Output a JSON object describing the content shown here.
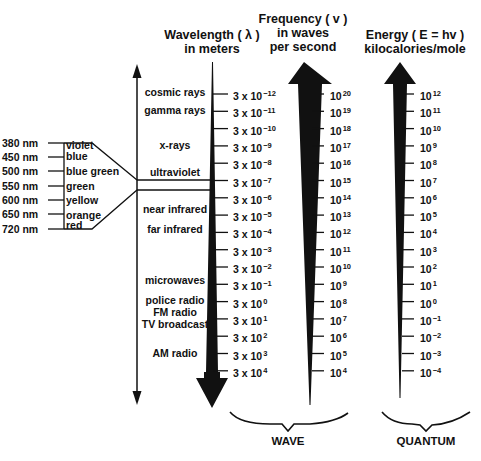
{
  "headers": {
    "wavelength": {
      "line1": "Wavelength ( λ )",
      "line2": "in meters"
    },
    "frequency": {
      "line1": "Frequency ( v )",
      "line2": "in waves",
      "line3": "per second"
    },
    "energy": {
      "line1": "Energy ( E = hv )",
      "line2": "kilocalories/mole"
    }
  },
  "bands": [
    {
      "label": "cosmic rays"
    },
    {
      "label": "gamma rays"
    },
    {
      "label": "x-rays"
    },
    {
      "label": "ultraviolet"
    },
    {
      "label": "near infrared"
    },
    {
      "label": "far infrared"
    },
    {
      "label": "microwaves"
    },
    {
      "label": "police radio"
    },
    {
      "label": "FM radio"
    },
    {
      "label": "TV broadcast"
    },
    {
      "label": "AM radio"
    }
  ],
  "visible_light": {
    "wavelengths": [
      "380 nm",
      "450 nm",
      "500 nm",
      "550 nm",
      "600 nm",
      "650 nm",
      "720 nm"
    ],
    "colors": [
      "violet",
      "blue",
      "blue green",
      "green",
      "yellow",
      "orange",
      "red"
    ]
  },
  "wavelength_ticks": [
    {
      "base": "3 x 10",
      "exp": "−12"
    },
    {
      "base": "3 x 10",
      "exp": "−11"
    },
    {
      "base": "3 x 10",
      "exp": "−10"
    },
    {
      "base": "3 x 10",
      "exp": "−9"
    },
    {
      "base": "3 x 10",
      "exp": "−8"
    },
    {
      "base": "3 x 10",
      "exp": "−7"
    },
    {
      "base": "3 x 10",
      "exp": "−6"
    },
    {
      "base": "3 x 10",
      "exp": "−5"
    },
    {
      "base": "3 x 10",
      "exp": "−4"
    },
    {
      "base": "3 x 10",
      "exp": "−3"
    },
    {
      "base": "3 x 10",
      "exp": "−2"
    },
    {
      "base": "3 x 10",
      "exp": "−1"
    },
    {
      "base": "3 x 10",
      "exp": "0"
    },
    {
      "base": "3 x 10",
      "exp": "1"
    },
    {
      "base": "3 x 10",
      "exp": "2"
    },
    {
      "base": "3 x 10",
      "exp": "3"
    },
    {
      "base": "3 x 10",
      "exp": "4"
    }
  ],
  "frequency_ticks": [
    {
      "base": "10",
      "exp": "20"
    },
    {
      "base": "10",
      "exp": "19"
    },
    {
      "base": "10",
      "exp": "18"
    },
    {
      "base": "10",
      "exp": "17"
    },
    {
      "base": "10",
      "exp": "16"
    },
    {
      "base": "10",
      "exp": "15"
    },
    {
      "base": "10",
      "exp": "14"
    },
    {
      "base": "10",
      "exp": "13"
    },
    {
      "base": "10",
      "exp": "12"
    },
    {
      "base": "10",
      "exp": "11"
    },
    {
      "base": "10",
      "exp": "10"
    },
    {
      "base": "10",
      "exp": "9"
    },
    {
      "base": "10",
      "exp": "8"
    },
    {
      "base": "10",
      "exp": "7"
    },
    {
      "base": "10",
      "exp": "6"
    },
    {
      "base": "10",
      "exp": "5"
    },
    {
      "base": "10",
      "exp": "4"
    }
  ],
  "energy_ticks": [
    {
      "base": "10",
      "exp": "12"
    },
    {
      "base": "10",
      "exp": "11"
    },
    {
      "base": "10",
      "exp": "10"
    },
    {
      "base": "10",
      "exp": "9"
    },
    {
      "base": "10",
      "exp": "8"
    },
    {
      "base": "10",
      "exp": "7"
    },
    {
      "base": "10",
      "exp": "6"
    },
    {
      "base": "10",
      "exp": "5"
    },
    {
      "base": "10",
      "exp": "4"
    },
    {
      "base": "10",
      "exp": "3"
    },
    {
      "base": "10",
      "exp": "2"
    },
    {
      "base": "10",
      "exp": "1"
    },
    {
      "base": "10",
      "exp": "0"
    },
    {
      "base": "10",
      "exp": "−1"
    },
    {
      "base": "10",
      "exp": "−2"
    },
    {
      "base": "10",
      "exp": "−3"
    },
    {
      "base": "10",
      "exp": "−4"
    }
  ],
  "captions": {
    "wave": "WAVE",
    "quantum": "QUANTUM"
  }
}
